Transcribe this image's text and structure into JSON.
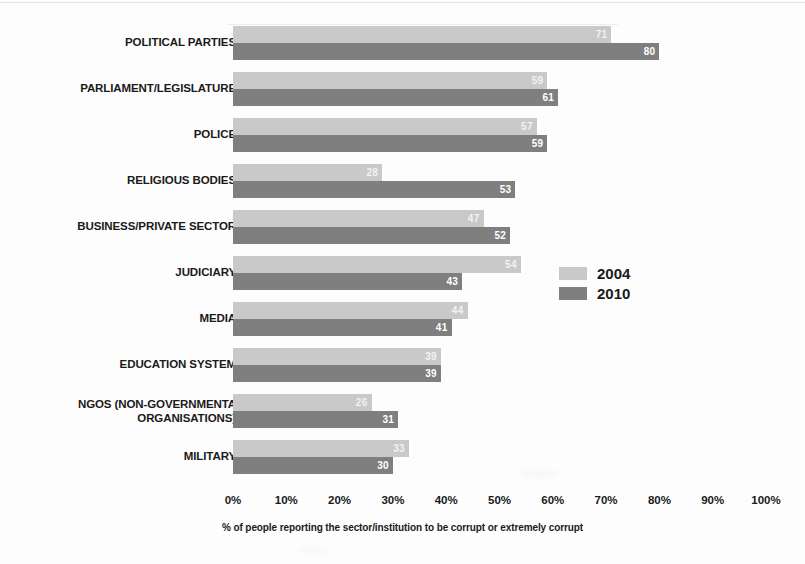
{
  "chart_data": {
    "type": "bar",
    "orientation": "horizontal",
    "title": "",
    "xlabel": "% of people reporting the sector/institution to be corrupt or extremely corrupt",
    "ylabel": "",
    "xlim": [
      0,
      100
    ],
    "grid": false,
    "legend_position": "middle-right",
    "categories": [
      "POLITICAL PARTIES",
      "PARLIAMENT/LEGISLATURE",
      "POLICE",
      "RELIGIOUS BODIES",
      "BUSINESS/PRIVATE SECTOR",
      "JUDICIARY",
      "MEDIA",
      "EDUCATION SYSTEM",
      "NGOS (NON-GOVERNMENTAL ORGANISATIONS)",
      "MILITARY"
    ],
    "category_lines": [
      [
        "POLITICAL PARTIES"
      ],
      [
        "PARLIAMENT/LEGISLATURE"
      ],
      [
        "POLICE"
      ],
      [
        "RELIGIOUS BODIES"
      ],
      [
        "BUSINESS/PRIVATE SECTOR"
      ],
      [
        "JUDICIARY"
      ],
      [
        "MEDIA"
      ],
      [
        "EDUCATION SYSTEM"
      ],
      [
        "NGOS (NON-GOVERNMENTA",
        "ORGANISATIONS)"
      ],
      [
        "MILITARY"
      ]
    ],
    "series": [
      {
        "name": "2004",
        "color": "#c9c9c9",
        "values": [
          71,
          59,
          57,
          28,
          47,
          54,
          44,
          39,
          26,
          33
        ]
      },
      {
        "name": "2010",
        "color": "#7f7f7f",
        "values": [
          80,
          61,
          59,
          53,
          52,
          43,
          41,
          39,
          31,
          30
        ]
      }
    ],
    "xticks": [
      0,
      10,
      20,
      30,
      40,
      50,
      60,
      70,
      80,
      90,
      100
    ],
    "xtick_labels": [
      "0%",
      "10%",
      "20%",
      "30%",
      "40%",
      "50%",
      "60%",
      "70%",
      "80%",
      "90%",
      "100%"
    ]
  },
  "legend": {
    "items": [
      {
        "label": "2004",
        "color": "#c9c9c9"
      },
      {
        "label": "2010",
        "color": "#7f7f7f"
      }
    ]
  },
  "axis": {
    "caption": "% of people reporting the sector/institution to be corrupt or extremely corrupt"
  },
  "colors": {
    "light_bar": "#c9c9c9",
    "dark_bar": "#7f7f7f",
    "text": "#1a1a1a",
    "background": "#fdfdfd"
  }
}
